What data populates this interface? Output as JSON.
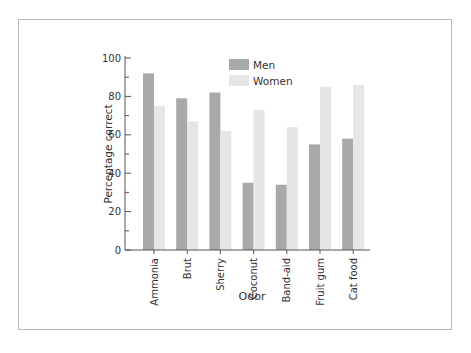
{
  "chart_data": {
    "type": "bar",
    "title": "",
    "xlabel": "Odor",
    "ylabel": "Percentage correct",
    "ylim": [
      0,
      100
    ],
    "yticks": [
      0,
      20,
      40,
      60,
      80,
      100
    ],
    "grid": false,
    "legend_position": "top-center",
    "categories": [
      "Ammonia",
      "Brut",
      "Sherry",
      "Coconut",
      "Band-aid",
      "Fruit gum",
      "Cat food"
    ],
    "series": [
      {
        "name": "Men",
        "color": "#a9a9a9",
        "values": [
          92,
          79,
          82,
          35,
          34,
          55,
          58
        ]
      },
      {
        "name": "Women",
        "color": "#e6e6e6",
        "values": [
          75,
          67,
          62,
          73,
          64,
          85,
          86
        ]
      }
    ]
  }
}
